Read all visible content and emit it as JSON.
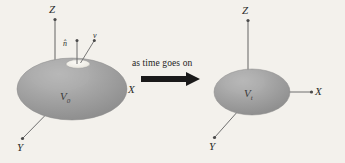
{
  "figure": {
    "background_color": "#f3f1ec",
    "ink_color": "#555555",
    "body_fill": "#9b9b9b",
    "body_fill_light": "#b3b3b3",
    "patch_color": "#f0efe9",
    "arrow_color": "#1a1a1a"
  },
  "transition": {
    "caption": "as time goes on",
    "arrow_icon": "right-arrow-icon"
  },
  "left_panel": {
    "name": "initial-state",
    "volume_label": "V",
    "volume_subscript": "0",
    "axes": [
      {
        "key": "z",
        "label": "Z"
      },
      {
        "key": "x",
        "label": "X"
      },
      {
        "key": "y",
        "label": "Y"
      }
    ],
    "vectors": [
      {
        "key": "normal",
        "label": "n̂",
        "描述": "unit normal"
      },
      {
        "key": "velocity",
        "label": "v⃗"
      }
    ]
  },
  "right_panel": {
    "name": "later-state",
    "volume_label": "V",
    "volume_subscript": "t",
    "axes": [
      {
        "key": "z",
        "label": "Z"
      },
      {
        "key": "x",
        "label": "X"
      },
      {
        "key": "y",
        "label": "Y"
      }
    ]
  }
}
